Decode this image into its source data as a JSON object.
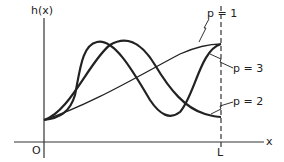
{
  "figure": {
    "y_axis_label": "h(x)",
    "x_axis_label": "x",
    "origin_label": "O",
    "boundary_label": "L",
    "curve_labels": {
      "p1": "p = 1",
      "p2": "p = 2",
      "p3": "p = 3"
    },
    "colors": {
      "ink": "#222222",
      "background": "#ffffff"
    }
  }
}
